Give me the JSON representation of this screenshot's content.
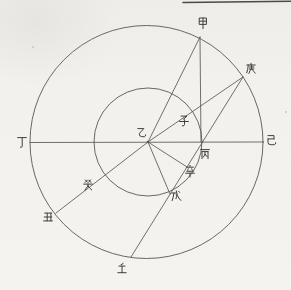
{
  "figure": {
    "description_labels": [
      "甲",
      "乙",
      "丙",
      "丁",
      "戊",
      "己",
      "庚",
      "辛",
      "壬",
      "癸",
      "子",
      "丑"
    ],
    "background_color": "#f2f1ed",
    "line_ink_color": "#5b5750",
    "glyph_ink_color": "#433f39",
    "top_rule": {
      "x1": 183,
      "y1": 2.5,
      "x2": 291,
      "y2": 1.2,
      "color": "#4a4a48",
      "width": 1.6
    },
    "outer_circle": {
      "cx": 146.5,
      "cy": 142,
      "r": 116.5
    },
    "inner_circle": {
      "cx": 148,
      "cy": 142,
      "r": 54
    },
    "center_point": {
      "x": 148,
      "y": 142
    },
    "lines": [
      {
        "name": "diameter-ding-ji",
        "x1": 30,
        "y1": 142.5,
        "x2": 263,
        "y2": 142
      },
      {
        "name": "vertical-jia-bing",
        "x1": 200,
        "y1": 37,
        "x2": 201,
        "y2": 142
      },
      {
        "name": "ray-yi-jia",
        "x1": 148,
        "y1": 142,
        "x2": 200,
        "y2": 37
      },
      {
        "name": "ray-yi-geng",
        "x1": 148,
        "y1": 142,
        "x2": 243,
        "y2": 77
      },
      {
        "name": "chord-geng-ren",
        "x1": 243,
        "y1": 77,
        "x2": 131,
        "y2": 257
      },
      {
        "name": "ray-yi-xin",
        "x1": 148,
        "y1": 142,
        "x2": 187,
        "y2": 167
      },
      {
        "name": "ray-yi-wu",
        "x1": 148,
        "y1": 142,
        "x2": 170,
        "y2": 194
      },
      {
        "name": "ray-yi-chou",
        "x1": 148,
        "y1": 142,
        "x2": 56,
        "y2": 213
      }
    ],
    "labels": [
      {
        "name": "label-jia",
        "glyph": "甲",
        "x": 203,
        "y": 23
      },
      {
        "name": "label-geng",
        "glyph": "庚",
        "x": 251,
        "y": 69
      },
      {
        "name": "label-zi",
        "glyph": "子",
        "x": 184,
        "y": 121
      },
      {
        "name": "label-yi",
        "glyph": "乙",
        "x": 141,
        "y": 133
      },
      {
        "name": "label-ding",
        "glyph": "丁",
        "x": 22,
        "y": 142
      },
      {
        "name": "label-ji",
        "glyph": "己",
        "x": 271,
        "y": 140
      },
      {
        "name": "label-bing",
        "glyph": "丙",
        "x": 205,
        "y": 154
      },
      {
        "name": "label-xin",
        "glyph": "辛",
        "x": 190,
        "y": 171
      },
      {
        "name": "label-wu",
        "glyph": "戊",
        "x": 176,
        "y": 196
      },
      {
        "name": "label-gui",
        "glyph": "癸",
        "x": 88,
        "y": 185
      },
      {
        "name": "label-chou",
        "glyph": "丑",
        "x": 48,
        "y": 217
      },
      {
        "name": "label-ren",
        "glyph": "壬",
        "x": 122,
        "y": 269
      }
    ],
    "specks": [
      {
        "x": 33,
        "y": 47
      },
      {
        "x": 286,
        "y": 112
      }
    ]
  }
}
